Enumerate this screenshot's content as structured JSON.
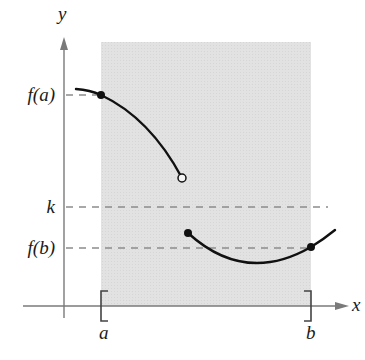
{
  "diagram": {
    "axes": {
      "x_label": "x",
      "y_label": "y",
      "axis_color": "#7a7a7a"
    },
    "interval": {
      "left_label": "a",
      "right_label": "b",
      "shade_color": "#e1e1e1"
    },
    "levels": [
      {
        "id": "fa",
        "label": "f(a)"
      },
      {
        "id": "k",
        "label": "k"
      },
      {
        "id": "fb",
        "label": "f(b)"
      }
    ],
    "curve_color": "#111111",
    "dash_color": "#8a8a8a",
    "points": [
      {
        "id": "a-point",
        "type": "filled"
      },
      {
        "id": "jump-open",
        "type": "open"
      },
      {
        "id": "jump-closed",
        "type": "filled"
      },
      {
        "id": "b-point",
        "type": "filled"
      }
    ]
  }
}
